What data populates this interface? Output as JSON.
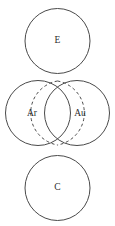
{
  "diagram": {
    "type": "venn-diagram",
    "background_color": "#ffffff",
    "stroke_color": "#4a4a4a",
    "label_color": "#2b2b2b",
    "sets": [
      {
        "id": "top",
        "label": "E",
        "cx": 57.5,
        "cy": 41,
        "r": 32.5,
        "style": "solid"
      },
      {
        "id": "middle-left",
        "label": "Ar",
        "cx": 38,
        "cy": 113,
        "r": 32.5,
        "style": "solid"
      },
      {
        "id": "middle-right",
        "label": "Au",
        "cx": 77,
        "cy": 113,
        "r": 32.5,
        "style": "solid"
      },
      {
        "id": "bottom",
        "label": "C",
        "cx": 57.5,
        "cy": 188,
        "r": 32.5,
        "style": "solid"
      }
    ],
    "intersection": {
      "id": "ar-au-overlap",
      "between": [
        "Ar",
        "Au"
      ],
      "label": "",
      "style": "dashed",
      "top_point": {
        "x": 57.5,
        "y": 81
      },
      "bottom_point": {
        "x": 57.5,
        "y": 145
      }
    },
    "labels": {
      "top_set": "E",
      "left_set": "Ar",
      "right_set": "Au",
      "bottom_set": "C"
    },
    "label_positions": {
      "top_set": {
        "x": 57.5,
        "y": 41
      },
      "left_set": {
        "x": 32,
        "y": 113.5
      },
      "right_set": {
        "x": 80,
        "y": 113.5
      },
      "bottom_set": {
        "x": 57.5,
        "y": 188
      }
    }
  }
}
